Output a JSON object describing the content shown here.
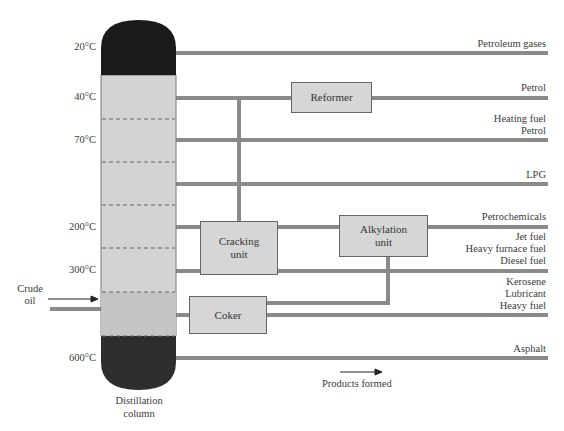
{
  "column": {
    "label_line1": "Distillation",
    "label_line2": "column",
    "temperatures": [
      "20°C",
      "40°C",
      "70°C",
      "200°C",
      "300°C",
      "600°C"
    ]
  },
  "input": {
    "label_line1": "Crude",
    "label_line2": "oil"
  },
  "units": {
    "reformer": "Reformer",
    "cracking_line1": "Cracking",
    "cracking_line2": "unit",
    "alkylation_line1": "Alkylation",
    "alkylation_line2": "unit",
    "coker": "Coker"
  },
  "products": {
    "p1": "Petroleum gases",
    "p2": "Petrol",
    "p3a": "Heating fuel",
    "p3b": "Petrol",
    "p4": "LPG",
    "p5": "Petrochemicals",
    "p6a": "Jet fuel",
    "p6b": "Heavy furnace fuel",
    "p6c": "Diesel fuel",
    "p7a": "Kerosene",
    "p7b": "Lubricant",
    "p7c": "Heavy fuel",
    "p8": "Asphalt"
  },
  "legend": {
    "products_formed": "Products formed"
  },
  "colors": {
    "pipe": "#8a8a8a",
    "column_body": "#d3d3d3",
    "column_top": "#1a1a1a",
    "column_bottom": "#2e2e2e",
    "unit_box": "#d6d6d6"
  }
}
